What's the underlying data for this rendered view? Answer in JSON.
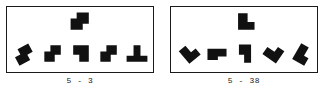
{
  "figure": {
    "type": "mental-rotation-item-pair",
    "background_color": "#ffffff",
    "ink_color": "#111111",
    "border_color": "#1a1a1a",
    "panels": [
      {
        "id": "panel-left",
        "caption": "5 - 3",
        "target": {
          "name": "S-tetromino",
          "cells": [
            [
              1,
              0
            ],
            [
              2,
              0
            ],
            [
              0,
              1
            ],
            [
              1,
              1
            ]
          ],
          "rotation_deg": 0
        },
        "options": [
          {
            "name": "S-tetromino-tilted",
            "cells": [
              [
                1,
                0
              ],
              [
                2,
                0
              ],
              [
                0,
                1
              ],
              [
                1,
                1
              ]
            ],
            "rotation_deg": -28
          },
          {
            "name": "S-tetromino",
            "cells": [
              [
                1,
                0
              ],
              [
                2,
                0
              ],
              [
                0,
                1
              ],
              [
                1,
                1
              ]
            ],
            "rotation_deg": 0
          },
          {
            "name": "Z-tetromino-mirror",
            "cells": [
              [
                0,
                0
              ],
              [
                1,
                0
              ],
              [
                1,
                1
              ],
              [
                2,
                1
              ]
            ],
            "rotation_deg": 180
          },
          {
            "name": "S-tetromino",
            "cells": [
              [
                1,
                0
              ],
              [
                2,
                0
              ],
              [
                0,
                1
              ],
              [
                1,
                1
              ]
            ],
            "rotation_deg": 0
          },
          {
            "name": "T-tetromino",
            "cells": [
              [
                1,
                0
              ],
              [
                0,
                1
              ],
              [
                1,
                1
              ],
              [
                2,
                1
              ]
            ],
            "rotation_deg": 0
          }
        ]
      },
      {
        "id": "panel-right",
        "caption": "5 - 38",
        "target": {
          "name": "L-tetromino",
          "cells": [
            [
              0,
              0
            ],
            [
              0,
              1
            ],
            [
              1,
              1
            ]
          ],
          "rotation_deg": 0
        },
        "options": [
          {
            "name": "L-tetromino-tilted",
            "cells": [
              [
                0,
                0
              ],
              [
                0,
                1
              ],
              [
                1,
                1
              ]
            ],
            "rotation_deg": -40
          },
          {
            "name": "J-tetromino",
            "cells": [
              [
                0,
                0
              ],
              [
                1,
                0
              ],
              [
                0,
                1
              ]
            ],
            "rotation_deg": 0
          },
          {
            "name": "L-tetromino-rotated",
            "cells": [
              [
                0,
                0
              ],
              [
                1,
                0
              ],
              [
                1,
                1
              ]
            ],
            "rotation_deg": 0
          },
          {
            "name": "L-tetromino-tilted",
            "cells": [
              [
                0,
                0
              ],
              [
                0,
                1
              ],
              [
                1,
                1
              ]
            ],
            "rotation_deg": -55
          },
          {
            "name": "L-tetromino-tilted",
            "cells": [
              [
                0,
                0
              ],
              [
                0,
                1
              ],
              [
                1,
                1
              ]
            ],
            "rotation_deg": 30
          }
        ]
      }
    ]
  }
}
